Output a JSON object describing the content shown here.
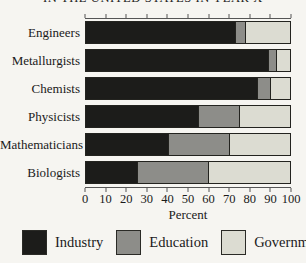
{
  "title": "IN THE UNITED STATES IN YEAR X",
  "chart_data": {
    "type": "bar",
    "orientation": "horizontal",
    "stacked": true,
    "categories": [
      "Engineers",
      "Metallurgists",
      "Chemists",
      "Physicists",
      "Mathematicians",
      "Biologists"
    ],
    "series": [
      {
        "name": "Industry",
        "color": "#1c1c1a",
        "values": [
          73,
          89,
          84,
          55,
          40,
          25
        ]
      },
      {
        "name": "Education",
        "color": "#8d8d89",
        "values": [
          5,
          4,
          6,
          20,
          30,
          35
        ]
      },
      {
        "name": "Government",
        "color": "#dcdcd2",
        "values": [
          22,
          7,
          10,
          25,
          30,
          40
        ]
      }
    ],
    "xlabel": "Percent",
    "xlim": [
      0,
      100
    ],
    "xticks": [
      0,
      10,
      20,
      30,
      40,
      50,
      60,
      70,
      80,
      90,
      100
    ],
    "grid": false,
    "legend_position": "bottom",
    "axis_ticks": "top-and-bottom"
  }
}
